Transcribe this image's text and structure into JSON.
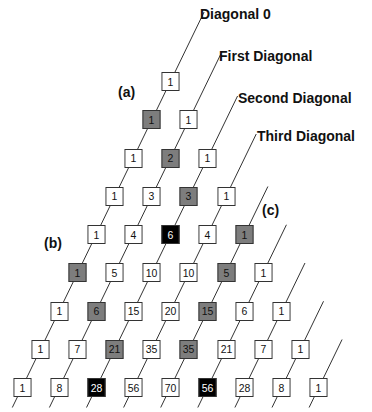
{
  "diagram": {
    "type": "pascals-triangle",
    "rows": [
      [
        1
      ],
      [
        1,
        1
      ],
      [
        1,
        2,
        1
      ],
      [
        1,
        3,
        3,
        1
      ],
      [
        1,
        4,
        6,
        4,
        1
      ],
      [
        1,
        5,
        10,
        10,
        5,
        1
      ],
      [
        1,
        6,
        15,
        20,
        15,
        6,
        1
      ],
      [
        1,
        7,
        21,
        35,
        35,
        21,
        7,
        1
      ],
      [
        1,
        8,
        28,
        56,
        70,
        56,
        28,
        8,
        1
      ]
    ],
    "highlights": {
      "gray": [
        [
          1,
          0
        ],
        [
          2,
          1
        ],
        [
          3,
          2
        ],
        [
          4,
          4
        ],
        [
          5,
          0
        ],
        [
          5,
          4
        ],
        [
          6,
          1
        ],
        [
          6,
          4
        ],
        [
          7,
          2
        ],
        [
          7,
          4
        ]
      ],
      "black": [
        [
          4,
          2
        ],
        [
          8,
          2
        ],
        [
          8,
          5
        ]
      ]
    },
    "colors": {
      "gray": "#7d7d7d",
      "black": "#000000",
      "box_border": "#333333",
      "line": "#333333"
    },
    "diagonal_labels": [
      {
        "text": "Diagonal 0",
        "x": 200,
        "y": 6
      },
      {
        "text": "First Diagonal",
        "x": 219,
        "y": 48
      },
      {
        "text": "Second Diagonal",
        "x": 238,
        "y": 90
      },
      {
        "text": "Third Diagonal",
        "x": 257,
        "y": 128
      }
    ],
    "region_labels": [
      {
        "text": "(a)",
        "x": 118,
        "y": 84
      },
      {
        "text": "(b)",
        "x": 44,
        "y": 235
      },
      {
        "text": "(c)",
        "x": 262,
        "y": 202
      }
    ]
  }
}
